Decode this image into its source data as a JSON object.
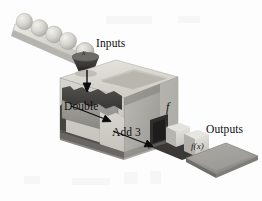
{
  "figure": {
    "background_color": "#fdfdfd",
    "palette": {
      "box_top": "#d8d6d0",
      "box_front_light": "#cfcdc7",
      "box_front_dark": "#8f8d88",
      "box_interior_dark": "#3d3c3a",
      "sphere": "#d2d0ca",
      "tray": "#9a9a97",
      "ink": "#0d0d0d"
    }
  },
  "labels": {
    "inputs": "Inputs",
    "outputs": "Outputs",
    "double": "Double",
    "add_three": "Add 3",
    "function_name": "f",
    "input_variable": "x",
    "output_variable": "f(x)"
  },
  "parts": {
    "input_ramp": "input-ramp",
    "input_spheres_count": 5,
    "hopper": "funnel-hopper",
    "machine_box": "function-machine-box",
    "first_stage": "Double",
    "second_stage": "Add 3",
    "output_chute": "output-chute",
    "output_cubes_count": 2,
    "output_tray": "output-tray"
  },
  "arrows": {
    "input_arrow": "down-arrow-into-machine",
    "double_arrow": "arrow-to-double-stage",
    "add3_arrow": "arrow-to-add3-stage"
  }
}
